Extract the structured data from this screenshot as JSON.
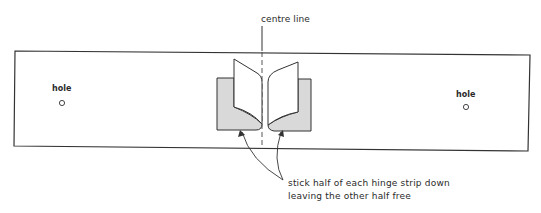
{
  "diagram": {
    "centre_line_label": "centre line",
    "hole_left_label": "hole",
    "hole_right_label": "hole",
    "annotation": {
      "line1": "stick half of each hinge strip down",
      "line2": "leaving the other half free"
    },
    "colors": {
      "stroke": "#333333",
      "hinge_fill": "#d9d9d9",
      "page_fill": "#ffffff",
      "background": "#ffffff"
    }
  }
}
